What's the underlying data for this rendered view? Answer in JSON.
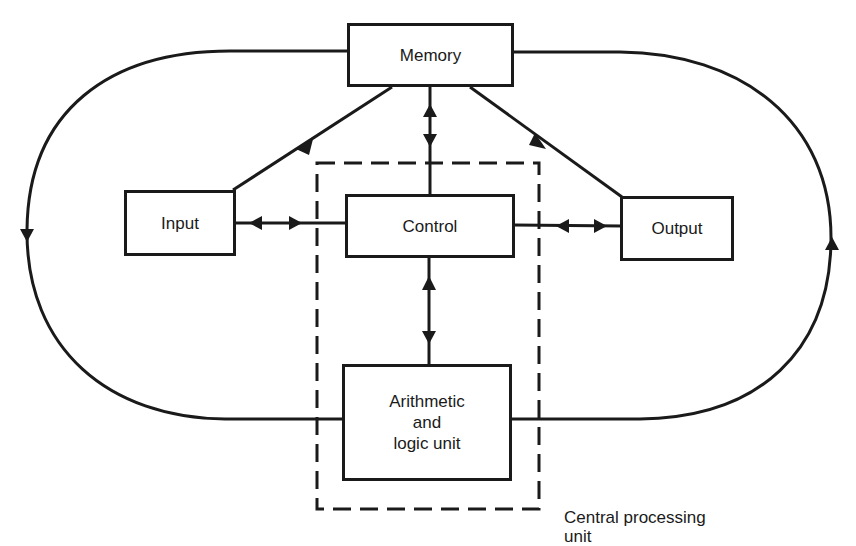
{
  "diagram": {
    "nodes": {
      "memory": {
        "label": "Memory"
      },
      "input": {
        "label": "Input"
      },
      "control": {
        "label": "Control"
      },
      "output": {
        "label": "Output"
      },
      "alu": {
        "line1": "Arithmetic",
        "line2": "and",
        "line3": "logic unit"
      }
    },
    "groups": {
      "cpu": {
        "line1": "Central processing",
        "line2": "unit",
        "style": "dashed"
      }
    },
    "edges": [
      {
        "from": "input",
        "to": "memory",
        "direction": "one-way"
      },
      {
        "from": "memory",
        "to": "output",
        "direction": "one-way"
      },
      {
        "from": "memory",
        "to": "control",
        "direction": "two-way"
      },
      {
        "from": "input",
        "to": "control",
        "direction": "two-way"
      },
      {
        "from": "control",
        "to": "output",
        "direction": "two-way"
      },
      {
        "from": "control",
        "to": "alu",
        "direction": "two-way"
      },
      {
        "from": "memory",
        "to": "alu",
        "direction": "one-way",
        "route": "left loop, downward"
      },
      {
        "from": "alu",
        "to": "memory",
        "direction": "one-way",
        "route": "right loop, upward"
      }
    ],
    "colors": {
      "line": "#1a1a1a",
      "background": "#ffffff"
    }
  }
}
